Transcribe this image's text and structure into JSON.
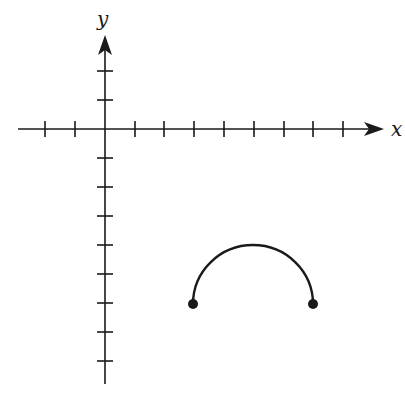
{
  "diagram": {
    "type": "coordinate-plane",
    "axes": {
      "x_label": "x",
      "y_label": "y",
      "x_ticks": [
        -2,
        -1,
        1,
        2,
        3,
        4,
        5,
        6,
        7,
        8
      ],
      "y_ticks": [
        2,
        1,
        -1,
        -2,
        -3,
        -4,
        -5,
        -6,
        -7,
        -8
      ]
    },
    "curve": {
      "shape": "upper semicircle",
      "center": [
        5,
        -6
      ],
      "radius": 2,
      "endpoints": [
        [
          3,
          -6
        ],
        [
          7,
          -6
        ]
      ],
      "endpoint_style": "closed",
      "top_point": [
        5,
        -4
      ]
    },
    "colors": {
      "ink": "#1a1a1a",
      "background": "#ffffff"
    }
  }
}
